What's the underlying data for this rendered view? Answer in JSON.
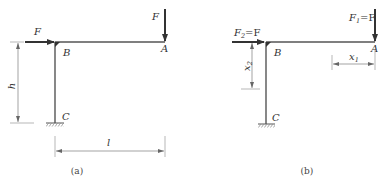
{
  "figure_a": {
    "caption": "(a)",
    "points": {
      "A": "A",
      "B": "B",
      "C": "C"
    },
    "forces": {
      "horizontal": "F",
      "vertical": "F"
    },
    "dimensions": {
      "height": "h",
      "length": "l"
    }
  },
  "figure_b": {
    "caption": "(b)",
    "points": {
      "A": "A",
      "B": "B",
      "C": "C"
    },
    "forces": {
      "horizontal": {
        "symbol": "F",
        "subscript": "2",
        "eq": "=F"
      },
      "vertical": {
        "symbol": "F",
        "subscript": "1",
        "eq": "=F"
      }
    },
    "dimensions": {
      "x1": {
        "symbol": "x",
        "subscript": "1"
      },
      "x2": {
        "symbol": "x",
        "subscript": "2"
      }
    }
  },
  "colors": {
    "member": "#555555",
    "force": "#333333",
    "dim": "#777777",
    "background": "#ffffff"
  }
}
